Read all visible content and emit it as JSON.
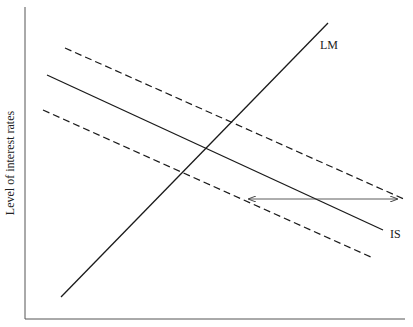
{
  "diagram": {
    "title": "",
    "y_axis_label": "Level of interest rates",
    "x_axis_label": "",
    "curves": [
      {
        "id": "lm",
        "label": "LM",
        "style": "solid",
        "x1": 61,
        "y1": 297,
        "x2": 328,
        "y2": 23
      },
      {
        "id": "is",
        "label": "IS",
        "style": "solid",
        "x1": 47,
        "y1": 75,
        "x2": 383,
        "y2": 230
      },
      {
        "id": "is-shift-up",
        "label": "",
        "style": "dashed",
        "x1": 65,
        "y1": 48,
        "x2": 406,
        "y2": 200
      },
      {
        "id": "is-shift-down",
        "label": "",
        "style": "dashed",
        "x1": 43,
        "y1": 110,
        "x2": 373,
        "y2": 258
      }
    ],
    "arrow": {
      "style": "double-headed",
      "x1": 249,
      "y1": 199,
      "x2": 397,
      "y2": 199
    },
    "colors": {
      "line": "#1a1a1a",
      "axis": "#555555",
      "text": "#222222"
    }
  }
}
